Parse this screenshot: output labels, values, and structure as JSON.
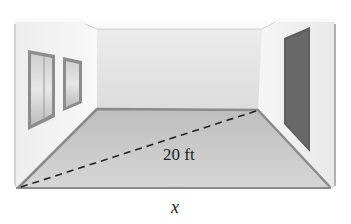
{
  "figure": {
    "labels": {
      "diagonal": "20 ft",
      "width": "x"
    },
    "colors": {
      "wall_light": "#f2f2f2",
      "back_wall": "#e6e6e6",
      "floor": "#c9c9c9",
      "baseboard": "#8a8a8a",
      "door": "#5e5e5e",
      "dash": "#222222"
    }
  }
}
